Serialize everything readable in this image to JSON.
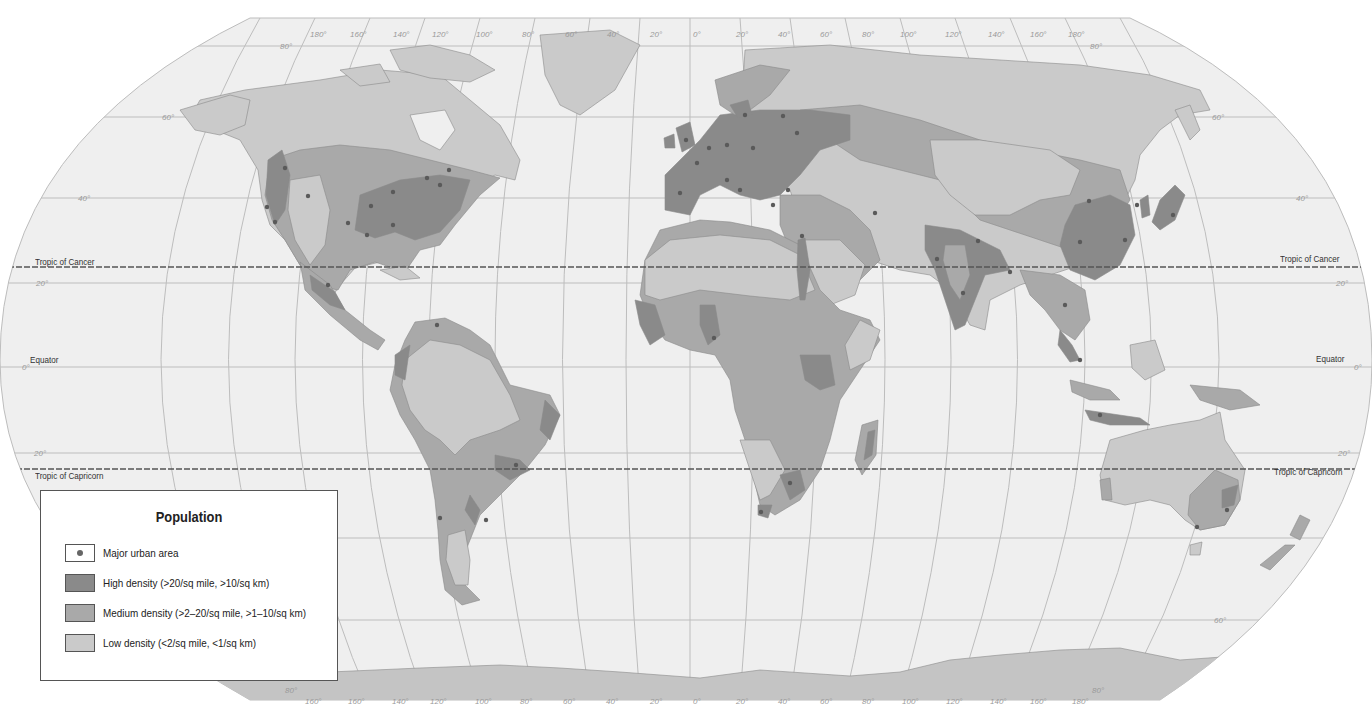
{
  "map": {
    "title": "World Population Density",
    "projection": "Robinson",
    "colors": {
      "ocean": "#efefef",
      "high": "#8a8a8a",
      "medium": "#a9a9a9",
      "low": "#cacaca",
      "city": "#5a5a5a",
      "grid": "#b8b8b8",
      "tropic_line": "#555555"
    },
    "lines": {
      "tropic_cancer": "Tropic of Cancer",
      "equator": "Equator",
      "tropic_capricorn": "Tropic of Capricorn"
    },
    "lat_labels": {
      "n80": "80°",
      "n60": "60°",
      "n40": "40°",
      "n20": "20°",
      "eq": "0°",
      "s20": "20°",
      "s60": "60°",
      "s80": "80°"
    },
    "lon_labels_top": [
      "180°",
      "160°",
      "140°",
      "120°",
      "100°",
      "80°",
      "60°",
      "40°",
      "20°",
      "0°",
      "20°",
      "40°",
      "60°",
      "80°",
      "100°",
      "120°",
      "140°",
      "160°",
      "180°"
    ],
    "lon_labels_bottom": [
      "160°",
      "160°",
      "140°",
      "120°",
      "100°",
      "80°",
      "60°",
      "40°",
      "20°",
      "0°",
      "20°",
      "40°",
      "60°",
      "80°",
      "100°",
      "120°",
      "140°",
      "160°",
      "180°"
    ]
  },
  "legend": {
    "title": "Population",
    "items": [
      {
        "label": "Major urban area",
        "swatch": "dot"
      },
      {
        "label": "High density (>20/sq mile, >10/sq km)",
        "swatch": "high"
      },
      {
        "label": "Medium density (>2–20/sq mile, >1–10/sq km)",
        "swatch": "medium"
      },
      {
        "label": "Low density (<2/sq mile, <1/sq km)",
        "swatch": "low"
      }
    ]
  }
}
